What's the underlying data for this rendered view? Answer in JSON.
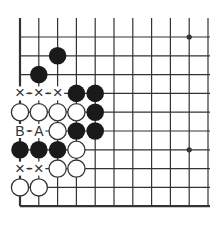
{
  "diagram": {
    "type": "go-board-fragment",
    "columns": 11,
    "rows": 10,
    "origin_x": 20,
    "origin_y": 37,
    "spacing": 18.8,
    "top_edge_open": true,
    "right_edge_open": true,
    "left_edge": true,
    "bottom_edge": true,
    "star_points": [
      [
        9,
        0
      ],
      [
        9,
        6
      ]
    ],
    "black_stones": [
      [
        2,
        1
      ],
      [
        1,
        2
      ],
      [
        3,
        3
      ],
      [
        4,
        3
      ],
      [
        4,
        4
      ],
      [
        3,
        5
      ],
      [
        4,
        5
      ],
      [
        0,
        6
      ],
      [
        1,
        6
      ],
      [
        2,
        6
      ]
    ],
    "white_stones": [
      [
        0,
        4
      ],
      [
        1,
        4
      ],
      [
        2,
        4
      ],
      [
        3,
        4
      ],
      [
        2,
        5
      ],
      [
        3,
        6
      ],
      [
        2,
        7
      ],
      [
        3,
        7
      ],
      [
        0,
        8
      ],
      [
        1,
        8
      ]
    ],
    "marks": [
      {
        "col": 0,
        "row": 3,
        "label": "×"
      },
      {
        "col": 1,
        "row": 3,
        "label": "×"
      },
      {
        "col": 2,
        "row": 3,
        "label": "×"
      },
      {
        "col": 0,
        "row": 5,
        "label": "B"
      },
      {
        "col": 1,
        "row": 5,
        "label": "A"
      },
      {
        "col": 0,
        "row": 7,
        "label": "×"
      },
      {
        "col": 1,
        "row": 7,
        "label": "×"
      }
    ],
    "colors": {
      "line": "#333333",
      "black": "#1a1a1a",
      "white": "#ffffff",
      "background": "#ffffff"
    }
  }
}
